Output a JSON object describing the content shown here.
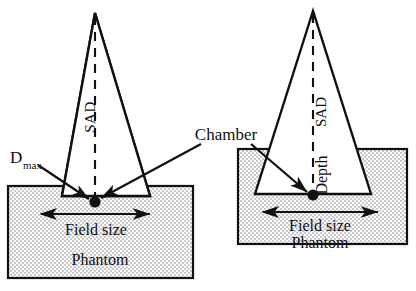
{
  "figure": {
    "title_visible": false,
    "background_color": "#ffffff",
    "line_color": "#111111",
    "phantom_fill_color": "#d9d9d9",
    "phantom_pattern": "fine-checkerboard-stipple",
    "panels": [
      {
        "id": "left-panel",
        "name": "dmax-setup",
        "beam": {
          "apex": {
            "x": 95,
            "y": 13
          },
          "bottom_left": {
            "x": 62,
            "y": 196
          },
          "bottom_right": {
            "x": 150,
            "y": 196
          },
          "style": "solid"
        },
        "central_axis": {
          "label": "SAD",
          "style": "dashed",
          "from": {
            "x": 95,
            "y": 15
          },
          "to": {
            "x": 95,
            "y": 202
          },
          "label_rotation": -90
        },
        "phantom": {
          "label": "Phantom",
          "x": 8,
          "y": 186,
          "width": 185,
          "height": 92
        },
        "chamber_point": {
          "x": 95,
          "y": 202
        },
        "field_size": {
          "label": "Field size",
          "arrow_from": {
            "x": 40,
            "y": 214
          },
          "arrow_to": {
            "x": 150,
            "y": 214
          },
          "label_x": 95,
          "label_y": 231
        },
        "depth_marker": {
          "label": "D",
          "subscript": "max",
          "label_x": 10,
          "label_y": 160
        }
      },
      {
        "id": "right-panel",
        "name": "depth-setup",
        "beam": {
          "apex": {
            "x": 313,
            "y": 11
          },
          "bottom_left": {
            "x": 255,
            "y": 194
          },
          "bottom_right": {
            "x": 371,
            "y": 194
          },
          "style": "solid"
        },
        "central_axis": {
          "label_upper": "SAD",
          "label_lower": "Depth",
          "style": "dashed",
          "from": {
            "x": 313,
            "y": 13
          },
          "to": {
            "x": 313,
            "y": 195
          },
          "label_rotation": -90
        },
        "phantom": {
          "label": "Phantom",
          "x": 238,
          "y": 149,
          "width": 169,
          "height": 95
        },
        "chamber_point": {
          "x": 313,
          "y": 195
        },
        "field_size": {
          "label": "Field size",
          "arrow_from": {
            "x": 262,
            "y": 212
          },
          "arrow_to": {
            "x": 378,
            "y": 212
          },
          "label_x": 320,
          "label_y": 228
        }
      }
    ],
    "annotations": [
      {
        "name": "chamber-annotation",
        "label": "Chamber",
        "label_x": 205,
        "label_y": 140,
        "leaders": [
          {
            "from": {
              "x": 203,
              "y": 146
            },
            "to": {
              "x": 100,
              "y": 199
            }
          },
          {
            "from": {
              "x": 250,
              "y": 146
            },
            "to": {
              "x": 308,
              "y": 193
            }
          }
        ]
      },
      {
        "name": "dmax-annotation",
        "label": "D",
        "sublabel": "max",
        "leaders": [
          {
            "from": {
              "x": 40,
              "y": 166
            },
            "to": {
              "x": 90,
              "y": 199
            }
          }
        ]
      }
    ],
    "labels": {
      "sad": "SAD",
      "depth": "Depth",
      "chamber": "Chamber",
      "field_size": "Field size",
      "phantom": "Phantom",
      "d_base": "D",
      "d_sub": "max"
    }
  }
}
